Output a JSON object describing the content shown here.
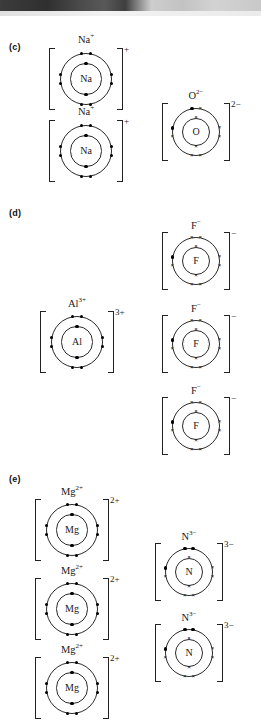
{
  "page": {
    "background": "#ffffff",
    "ink": "#1a1a1a"
  },
  "artifact": {
    "name": "scan-edge-band",
    "present": true
  },
  "sections": [
    {
      "id": "c",
      "label": "(c)"
    },
    {
      "id": "d",
      "label": "(d)"
    },
    {
      "id": "e",
      "label": "(e)"
    }
  ],
  "legend": {
    "dot_meaning": "electron transferred from metal",
    "cross_meaning": "original non-metal electron"
  },
  "ions": [
    {
      "key": "na1",
      "section": "c",
      "label": "Na",
      "label_charge": "+",
      "symbol": "Na",
      "bracket_charge": "+",
      "inner": {
        "dots": 2,
        "crosses": 0
      },
      "outer": {
        "dots": 8,
        "crosses": 0
      }
    },
    {
      "key": "na2",
      "section": "c",
      "label": "Na",
      "label_charge": "+",
      "symbol": "Na",
      "bracket_charge": "+",
      "inner": {
        "dots": 2,
        "crosses": 0
      },
      "outer": {
        "dots": 8,
        "crosses": 0
      }
    },
    {
      "key": "o1",
      "section": "c",
      "label": "O",
      "label_charge": "2−",
      "symbol": "O",
      "bracket_charge": "2−",
      "inner": {
        "dots": 0,
        "crosses": 2
      },
      "outer": {
        "dots": 2,
        "crosses": 6
      }
    },
    {
      "key": "al1",
      "section": "d",
      "label": "Al",
      "label_charge": "3+",
      "symbol": "Al",
      "bracket_charge": "3+",
      "inner": {
        "dots": 2,
        "crosses": 0
      },
      "outer": {
        "dots": 8,
        "crosses": 0
      }
    },
    {
      "key": "f1",
      "section": "d",
      "label": "F",
      "label_charge": "−",
      "symbol": "F",
      "bracket_charge": "−",
      "inner": {
        "dots": 0,
        "crosses": 2
      },
      "outer": {
        "dots": 1,
        "crosses": 7
      }
    },
    {
      "key": "f2",
      "section": "d",
      "label": "F",
      "label_charge": "−",
      "symbol": "F",
      "bracket_charge": "−",
      "inner": {
        "dots": 0,
        "crosses": 2
      },
      "outer": {
        "dots": 1,
        "crosses": 7
      }
    },
    {
      "key": "f3",
      "section": "d",
      "label": "F",
      "label_charge": "−",
      "symbol": "F",
      "bracket_charge": "−",
      "inner": {
        "dots": 0,
        "crosses": 2
      },
      "outer": {
        "dots": 1,
        "crosses": 7
      }
    },
    {
      "key": "mg1",
      "section": "e",
      "label": "Mg",
      "label_charge": "2+",
      "symbol": "Mg",
      "bracket_charge": "2+",
      "inner": {
        "dots": 2,
        "crosses": 0
      },
      "outer": {
        "dots": 8,
        "crosses": 0
      }
    },
    {
      "key": "mg2",
      "section": "e",
      "label": "Mg",
      "label_charge": "2+",
      "symbol": "Mg",
      "bracket_charge": "2+",
      "inner": {
        "dots": 2,
        "crosses": 0
      },
      "outer": {
        "dots": 8,
        "crosses": 0
      }
    },
    {
      "key": "mg3",
      "section": "e",
      "label": "Mg",
      "label_charge": "2+",
      "symbol": "Mg",
      "bracket_charge": "2+",
      "inner": {
        "dots": 2,
        "crosses": 0
      },
      "outer": {
        "dots": 8,
        "crosses": 0
      }
    },
    {
      "key": "n1",
      "section": "e",
      "label": "N",
      "label_charge": "3−",
      "symbol": "N",
      "bracket_charge": "3−",
      "inner": {
        "dots": 0,
        "crosses": 2
      },
      "outer": {
        "dots": 3,
        "crosses": 5
      }
    },
    {
      "key": "n2",
      "section": "e",
      "label": "N",
      "label_charge": "3−",
      "symbol": "N",
      "bracket_charge": "3−",
      "inner": {
        "dots": 0,
        "crosses": 2
      },
      "outer": {
        "dots": 3,
        "crosses": 5
      }
    }
  ]
}
